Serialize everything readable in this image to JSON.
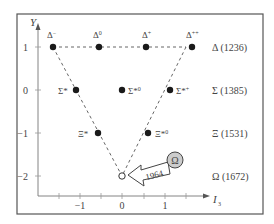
{
  "diagram": {
    "axes": {
      "y_label": "Y",
      "x_label": "I",
      "x_label_sub": "3",
      "x_ticks": [
        "−1",
        "0",
        "1"
      ],
      "y_ticks": [
        "1",
        "0",
        "−1",
        "−2"
      ]
    },
    "particles": [
      {
        "name": "Δ",
        "sup": "−",
        "I3": -1.5,
        "Y": 1,
        "filled": true
      },
      {
        "name": "Δ",
        "sup": "0",
        "I3": -0.5,
        "Y": 1,
        "filled": true
      },
      {
        "name": "Δ",
        "sup": "+",
        "I3": 0.5,
        "Y": 1,
        "filled": true
      },
      {
        "name": "Δ",
        "sup": "++",
        "I3": 1.5,
        "Y": 1,
        "filled": true
      },
      {
        "name": "Σ*",
        "sup": "−",
        "I3": -1,
        "Y": 0,
        "filled": true
      },
      {
        "name": "Σ*",
        "sup": "0",
        "I3": 0,
        "Y": 0,
        "filled": true
      },
      {
        "name": "Σ*",
        "sup": "+",
        "I3": 1,
        "Y": 0,
        "filled": true
      },
      {
        "name": "Ξ*",
        "sup": "−",
        "I3": -0.5,
        "Y": -1,
        "filled": true
      },
      {
        "name": "Ξ*",
        "sup": "0",
        "I3": 0.5,
        "Y": -1,
        "filled": true
      },
      {
        "name": "Ω",
        "sup": "−",
        "I3": 0,
        "Y": -2,
        "filled": false
      }
    ],
    "multiplets": [
      {
        "label": "Δ (1236)",
        "Y": 1
      },
      {
        "label": "Σ (1385)",
        "Y": 0
      },
      {
        "label": "Ξ (1531)",
        "Y": -1
      },
      {
        "label": "Ω (1672)",
        "Y": -2
      }
    ],
    "callout": {
      "year": "1964",
      "symbol": "Ω"
    },
    "colors": {
      "frame": "#555555",
      "axis": "#777777",
      "dot": "#1a1a1a",
      "text": "#444444",
      "callout_fill": "#cccccc"
    }
  }
}
